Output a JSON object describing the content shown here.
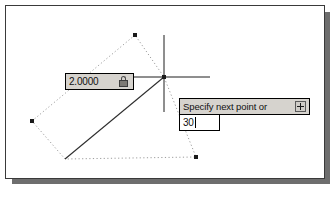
{
  "app": {
    "name": "CAD drawing window",
    "frame_border_color": "#3a3a3a",
    "canvas_color": "#ffffff",
    "shadow_color": "#6e6e6e"
  },
  "dynamic_input": {
    "distance_field": {
      "value": "2.0000",
      "lock_icon": "lock-icon",
      "locked": true,
      "background_color": "#d6d3ce"
    },
    "prompt_tooltip": {
      "text": "Specify next point or",
      "expand_icon": "expand-plus-icon",
      "background_color": "#d6d3ce"
    },
    "angle_field": {
      "value": "30",
      "caret_visible": true,
      "background_color": "#ffffff"
    }
  },
  "cursor": {
    "type": "crosshair-cursor",
    "center_x": 164,
    "center_y": 77,
    "pick_point_marker": "pick-point-node"
  },
  "geometry": {
    "rubber_band_line": {
      "type": "solid-line",
      "color": "#2d2d2d",
      "from": [
        65,
        159
      ],
      "to": [
        164,
        77
      ]
    },
    "reference_polygon": {
      "type": "dotted-polyline",
      "color": "#9a9a9a",
      "points": [
        [
          135,
          35
        ],
        [
          32,
          121
        ],
        [
          65,
          159
        ],
        [
          196,
          157
        ],
        [
          164,
          77
        ]
      ]
    },
    "snap_nodes": [
      {
        "name": "node-top",
        "x": 135,
        "y": 35
      },
      {
        "name": "node-left",
        "x": 32,
        "y": 121
      },
      {
        "name": "node-bottom-right",
        "x": 196,
        "y": 157
      },
      {
        "name": "node-cursor",
        "x": 164,
        "y": 77
      }
    ]
  }
}
